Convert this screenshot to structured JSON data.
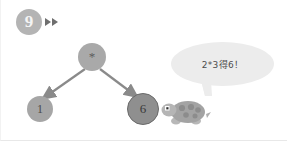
{
  "step": {
    "number": "9",
    "forward_icon": "fast-forward-icon"
  },
  "tree": {
    "root": {
      "label": "*"
    },
    "left": {
      "label": "1"
    },
    "right": {
      "label": "6"
    }
  },
  "speech": {
    "text": "2*3得6！"
  },
  "mascot": {
    "name": "turtle-mascot"
  },
  "colors": {
    "background": "#ffffff",
    "badge": "#b4b4b4",
    "node_default": "#a6a6a6",
    "node_highlight": "#8f8f8f",
    "bubble": "#ececec",
    "edge": "#8a8a8a",
    "turtle_shell": "#9a9a9a"
  }
}
